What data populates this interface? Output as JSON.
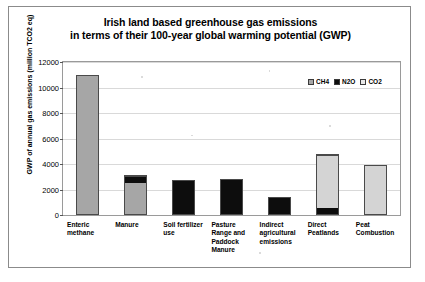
{
  "chart_data": {
    "type": "bar",
    "title": "Irish land based greenhouse gas emissions in terms of their 100-year global warming potential (GWP)",
    "title_lines": [
      "Irish land based greenhouse gas emissions",
      "in terms of their 100-year global warming potential (GWP)"
    ],
    "xlabel": "",
    "ylabel": "GWP of annual gas emissions (million TCO2 eq)",
    "ylim": [
      0,
      12000
    ],
    "ytick_values": [
      0,
      2000,
      4000,
      6000,
      8000,
      10000,
      12000
    ],
    "ytick_labels": [
      "0",
      "2000",
      "4000",
      "6000",
      "8000",
      "10000",
      "12000"
    ],
    "grid": true,
    "stacked": true,
    "legend_position": "top-right",
    "legend": [
      {
        "name": "CH4",
        "color": "#a6a6a6"
      },
      {
        "name": "N2O",
        "color": "#0d0d0d"
      },
      {
        "name": "CO2",
        "color": "#e8e8e8"
      }
    ],
    "categories": [
      "Enteric methane",
      "Manure",
      "Soil fertilizer use",
      "Pasture Range and Paddock Manure",
      "Indirect agricultural emissions",
      "Direct Peatlands",
      "Peat Combustion"
    ],
    "category_label_lines": [
      [
        "Enteric",
        "methane"
      ],
      [
        "Manure"
      ],
      [
        "Soil fertilizer",
        "use"
      ],
      [
        "Pasture",
        "Range and",
        "Paddock",
        "Manure"
      ],
      [
        "Indirect",
        "agricultural",
        "emissions"
      ],
      [
        "Direct",
        "Peatlands"
      ],
      [
        "Peat",
        "Combustion"
      ]
    ],
    "series": [
      {
        "name": "CH4",
        "color": "#a6a6a6",
        "values": [
          11000,
          2600,
          0,
          0,
          0,
          0,
          0
        ]
      },
      {
        "name": "N2O",
        "color": "#0d0d0d",
        "values": [
          0,
          500,
          2750,
          2800,
          1400,
          500,
          0
        ]
      },
      {
        "name": "CO2",
        "color": "#e8e8e8",
        "values": [
          0,
          0,
          0,
          0,
          0,
          4300,
          3900
        ]
      }
    ],
    "totals": [
      11000,
      3100,
      2750,
      2800,
      1400,
      4800,
      3900
    ]
  },
  "colors": {
    "ch4": "#a6a6a6",
    "n2o": "#0d0d0d",
    "co2": "#d4d4d4",
    "grid": "#d9d9d9",
    "axis": "#9a9a9a",
    "page_border": "#8b8b8b",
    "text": "#000000"
  }
}
